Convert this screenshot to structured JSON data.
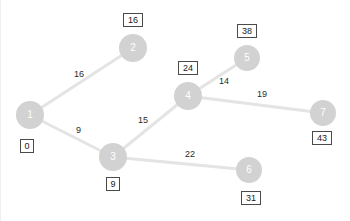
{
  "diagram": {
    "type": "node-link-graph",
    "canvas": {
      "width": 350,
      "height": 221,
      "background": "#ffffff"
    },
    "style": {
      "node_fill": "#d2d2d2",
      "node_label_color": "#ffffff",
      "edge_color": "#e4e4e4",
      "box_border": "#4a4a4a",
      "box_fill": "#ffffff",
      "label_color": "#2b2b2b"
    },
    "nodes": [
      {
        "id": "1",
        "label": "1",
        "x": 30,
        "y": 115,
        "r": 14,
        "dist": "0",
        "dist_x": 27,
        "dist_y": 146,
        "dist_pos": "below"
      },
      {
        "id": "2",
        "label": "2",
        "x": 133,
        "y": 48,
        "r": 14,
        "dist": "16",
        "dist_x": 133,
        "dist_y": 20,
        "dist_pos": "above"
      },
      {
        "id": "3",
        "label": "3",
        "x": 113,
        "y": 157,
        "r": 14,
        "dist": "9",
        "dist_x": 113,
        "dist_y": 184,
        "dist_pos": "below"
      },
      {
        "id": "4",
        "label": "4",
        "x": 188,
        "y": 96,
        "r": 14,
        "dist": "24",
        "dist_x": 188,
        "dist_y": 68,
        "dist_pos": "above"
      },
      {
        "id": "5",
        "label": "5",
        "x": 247,
        "y": 58,
        "r": 13,
        "dist": "38",
        "dist_x": 247,
        "dist_y": 31,
        "dist_pos": "above"
      },
      {
        "id": "6",
        "label": "6",
        "x": 249,
        "y": 170,
        "r": 13,
        "dist": "31",
        "dist_x": 251,
        "dist_y": 198,
        "dist_pos": "below"
      },
      {
        "id": "7",
        "label": "7",
        "x": 323,
        "y": 113,
        "r": 13,
        "dist": "43",
        "dist_x": 322,
        "dist_y": 138,
        "dist_pos": "below"
      }
    ],
    "edges": [
      {
        "from": "1",
        "to": "2",
        "weight": "16",
        "label_x": 74,
        "label_y": 70
      },
      {
        "from": "1",
        "to": "3",
        "weight": "9",
        "label_x": 76,
        "label_y": 126
      },
      {
        "from": "3",
        "to": "4",
        "weight": "15",
        "label_x": 138,
        "label_y": 116
      },
      {
        "from": "3",
        "to": "6",
        "weight": "22",
        "label_x": 185,
        "label_y": 150
      },
      {
        "from": "4",
        "to": "5",
        "weight": "14",
        "label_x": 219,
        "label_y": 77
      },
      {
        "from": "4",
        "to": "7",
        "weight": "19",
        "label_x": 257,
        "label_y": 90
      }
    ]
  }
}
